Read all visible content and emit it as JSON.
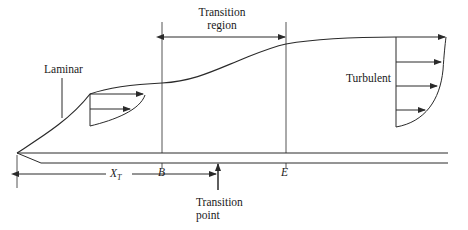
{
  "diagram": {
    "labels": {
      "transition_region_line1": "Transition",
      "transition_region_line2": "region",
      "laminar": "Laminar",
      "turbulent": "Turbulent",
      "point_b": "B",
      "point_e": "E",
      "x_t": "X",
      "x_t_sub": "T",
      "transition_point_line1": "Transition",
      "transition_point_line2": "point"
    },
    "regions": [
      {
        "name": "Laminar",
        "velocity_profile_arrows": 2
      },
      {
        "name": "Transition region",
        "from": "B",
        "to": "E"
      },
      {
        "name": "Turbulent",
        "velocity_profile_arrows": 4
      }
    ],
    "colors": {
      "line": "#2a2a2a",
      "background": "#ffffff"
    }
  }
}
